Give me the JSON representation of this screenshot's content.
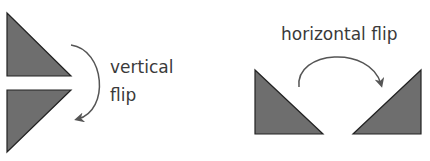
{
  "diagram": {
    "vertical": {
      "line1": "vertical",
      "line2": "flip"
    },
    "horizontal": {
      "label": "horizontal flip"
    },
    "colors": {
      "triangle_fill": "#6e6e6e",
      "stroke": "#222222",
      "arrow": "#555555"
    }
  }
}
